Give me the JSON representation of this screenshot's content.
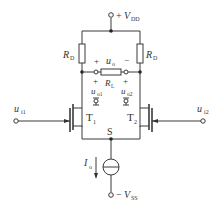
{
  "diagram": {
    "type": "MOSFET differential amplifier circuit",
    "supply_positive": {
      "sign": "+",
      "symbol": "V",
      "subscript": "DD"
    },
    "supply_negative": {
      "sign": "−",
      "symbol": "V",
      "subscript": "SS"
    },
    "resistor_left": {
      "symbol": "R",
      "subscript": "D"
    },
    "resistor_right": {
      "symbol": "R",
      "subscript": "D"
    },
    "load_resistor": {
      "symbol": "R",
      "subscript": "L"
    },
    "output": {
      "symbol": "u",
      "subscript": "o",
      "plus": "+",
      "minus": "−"
    },
    "load_terminals": {
      "left_sign": "+",
      "right_sign": "+"
    },
    "output1": {
      "symbol": "u",
      "subscript": "o1"
    },
    "output2": {
      "symbol": "u",
      "subscript": "o2"
    },
    "transistor1": {
      "symbol": "T",
      "subscript": "1"
    },
    "transistor2": {
      "symbol": "T",
      "subscript": "2"
    },
    "source_node": {
      "label": "S"
    },
    "current_source": {
      "symbol": "I",
      "subscript": "o"
    },
    "input1": {
      "symbol": "u",
      "subscript": "i1"
    },
    "input2": {
      "symbol": "u",
      "subscript": "i2"
    }
  },
  "colors": {
    "line": "#3a3a3a",
    "text": "#333333",
    "background": "#ffffff"
  }
}
